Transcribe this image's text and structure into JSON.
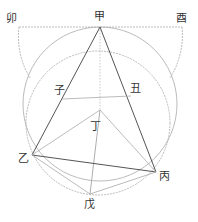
{
  "diagram": {
    "title": "",
    "colors": {
      "background": "#ffffff",
      "solid_line": "#555555",
      "light_line": "#aaaaaa",
      "dotted_line": "#bbbbbb",
      "label": "#333333"
    },
    "points": {
      "jia": {
        "label": "甲",
        "x": 100,
        "y": 27
      },
      "mao": {
        "label": "卯",
        "x": 19,
        "y": 27
      },
      "you": {
        "label": "酉",
        "x": 182,
        "y": 27
      },
      "zi": {
        "label": "子",
        "x": 62,
        "y": 99
      },
      "chou": {
        "label": "丑",
        "x": 131,
        "y": 96
      },
      "ding": {
        "label": "丁",
        "x": 100,
        "y": 110
      },
      "yi": {
        "label": "乙",
        "x": 32,
        "y": 155
      },
      "bing": {
        "label": "丙",
        "x": 156,
        "y": 172
      },
      "wu": {
        "label": "戊",
        "x": 90,
        "y": 194
      }
    },
    "labels": {
      "jia": "甲",
      "mao": "卯",
      "you": "酉",
      "zi": "子",
      "chou": "丑",
      "ding": "丁",
      "yi": "乙",
      "bing": "丙",
      "wu": "戊"
    }
  }
}
